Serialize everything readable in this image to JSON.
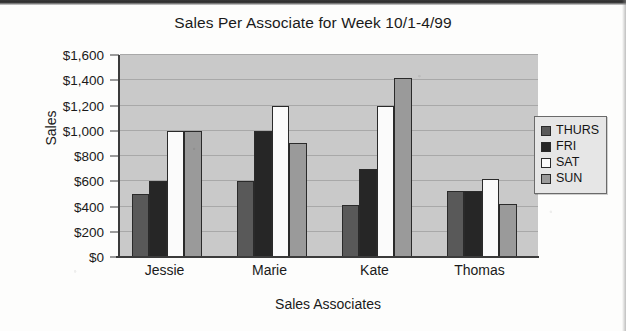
{
  "chart_data": {
    "type": "bar",
    "title": "Sales Per Associate for Week 10/1-4/99",
    "xlabel": "Sales Associates",
    "ylabel": "Sales",
    "categories": [
      "Jessie",
      "Marie",
      "Kate",
      "Thomas"
    ],
    "series": [
      {
        "name": "THURS",
        "color": "#595959",
        "values": [
          500,
          600,
          410,
          520
        ]
      },
      {
        "name": "FRI",
        "color": "#262626",
        "values": [
          600,
          1000,
          700,
          520
        ]
      },
      {
        "name": "SAT",
        "color": "#fbfbfb",
        "values": [
          1000,
          1200,
          1200,
          620
        ]
      },
      {
        "name": "SUN",
        "color": "#9a9a9a",
        "values": [
          1000,
          900,
          1420,
          420
        ]
      }
    ],
    "ylim": [
      0,
      1600
    ],
    "ytick_values": [
      0,
      200,
      400,
      600,
      800,
      1000,
      1200,
      1400,
      1600
    ],
    "ytick_labels": [
      "$0",
      "$200",
      "$400",
      "$600",
      "$800",
      "$1,000",
      "$1,200",
      "$1,400",
      "$1,600"
    ],
    "grid": true,
    "legend_position": "right",
    "plot_background": "#c9c9c9"
  }
}
